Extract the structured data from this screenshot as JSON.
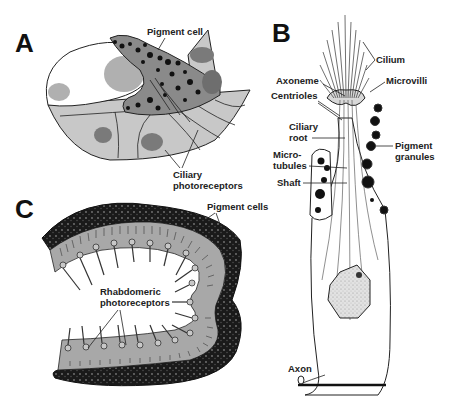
{
  "figure": {
    "panels": [
      {
        "id": "A",
        "letter": "A",
        "labels": {
          "pigment_cell": "Pigment cell",
          "ciliary_line1": "Ciliary",
          "ciliary_line2": "photoreceptors"
        }
      },
      {
        "id": "B",
        "letter": "B",
        "labels": {
          "cilium": "Cilium",
          "axoneme": "Axoneme",
          "microvilli": "Microvilli",
          "centrioles": "Centrioles",
          "ciliary_root_line1": "Ciliary",
          "ciliary_root_line2": "root",
          "pigment_granules_line1": "Pigment",
          "pigment_granules_line2": "granules",
          "microtubules_line1": "Micro-",
          "microtubules_line2": "tubules",
          "shaft": "Shaft",
          "axon": "Axon"
        }
      },
      {
        "id": "C",
        "letter": "C",
        "labels": {
          "pigment_cells": "Pigment cells",
          "rhabdomeric_line1": "Rhabdomeric",
          "rhabdomeric_line2": "photoreceptors"
        }
      }
    ],
    "colors": {
      "cell_fill": "#c8c8c8",
      "pigment_cell_fill": "#8a8a8a",
      "nucleus_fill": "#7a7a7a",
      "nucleus_light": "#b0b0b0",
      "granule": "#111111",
      "nucleus_dotted": "#d8d8d8",
      "outline": "#222222"
    }
  }
}
